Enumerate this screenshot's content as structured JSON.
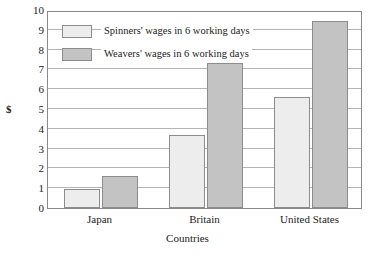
{
  "chart_data": {
    "type": "bar",
    "title": "",
    "subtitle": "",
    "xlabel": "Countries",
    "ylabel": "$",
    "categories": [
      "Japan",
      "Britain",
      "United States"
    ],
    "series": [
      {
        "name": "Spinners' wages in 6 working days",
        "color": "#ededed",
        "values": [
          0.95,
          3.7,
          5.6
        ]
      },
      {
        "name": "Weavers' wages in 6 working days",
        "color": "#c3c3c3",
        "values": [
          1.6,
          7.3,
          9.45
        ]
      }
    ],
    "ylim": [
      0,
      10
    ],
    "yticks": [
      0,
      1,
      2,
      3,
      4,
      5,
      6,
      7,
      8,
      9,
      10
    ],
    "ytick_labels": [
      "0",
      "1",
      "2",
      "3",
      "4",
      "5",
      "6",
      "7",
      "8",
      "9",
      "10"
    ],
    "grid": true,
    "grid_axis": "y",
    "legend_position": "upper-left-inside",
    "bar_border_color": "#8c8c8c",
    "frame_color": "#8a8a8a",
    "gridline_color": "#b4b4b4"
  }
}
